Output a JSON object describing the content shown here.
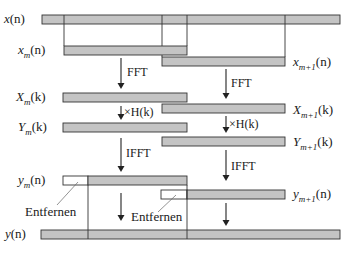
{
  "diagram": {
    "type": "overlap-save block convolution",
    "signals": {
      "x": {
        "base": "x",
        "sub": "",
        "arg": "(n)"
      },
      "xm": {
        "base": "x",
        "sub": "m",
        "arg": "(n)"
      },
      "xm1": {
        "base": "x",
        "sub": "m+1",
        "arg": "(n)"
      },
      "Xm": {
        "base": "X",
        "sub": "m",
        "arg": "(k)"
      },
      "Xm1": {
        "base": "X",
        "sub": "m+1",
        "arg": "(k)"
      },
      "Ym": {
        "base": "Y",
        "sub": "m",
        "arg": "(k)"
      },
      "Ym1": {
        "base": "Y",
        "sub": "m+1",
        "arg": "(k)"
      },
      "ym": {
        "base": "y",
        "sub": "m",
        "arg": "(n)"
      },
      "ym1": {
        "base": "y",
        "sub": "m+1",
        "arg": "(n)"
      },
      "y": {
        "base": "y",
        "sub": "",
        "arg": "(n)"
      }
    },
    "operations": {
      "fft": "FFT",
      "mult": "×H(k)",
      "ifft": "IFFT"
    },
    "notes": {
      "remove": "Entfernen"
    },
    "colors": {
      "bar_fill": "#c4c4c4",
      "bar_stroke": "#333333",
      "discard_fill": "#ffffff"
    }
  }
}
